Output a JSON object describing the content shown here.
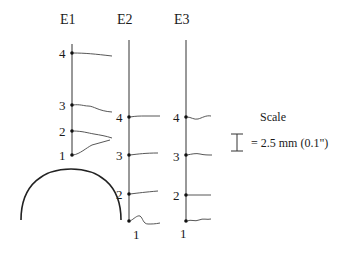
{
  "diagram": {
    "electrodes": [
      {
        "title": "E1",
        "x": 72,
        "points": [
          {
            "label": "4",
            "y": 53
          },
          {
            "label": "3",
            "y": 105
          },
          {
            "label": "2",
            "y": 131
          },
          {
            "label": "1",
            "y": 155
          }
        ]
      },
      {
        "title": "E2",
        "x": 129,
        "points": [
          {
            "label": "4",
            "y": 117
          },
          {
            "label": "3",
            "y": 155
          },
          {
            "label": "2",
            "y": 194
          },
          {
            "label": "1",
            "y": 221
          }
        ]
      },
      {
        "title": "E3",
        "x": 186,
        "points": [
          {
            "label": "4",
            "y": 117
          },
          {
            "label": "3",
            "y": 155
          },
          {
            "label": "2",
            "y": 195
          },
          {
            "label": "1",
            "y": 221
          }
        ]
      }
    ],
    "scale": {
      "title": "Scale",
      "text": "= 2.5 mm (0.1\")"
    }
  }
}
